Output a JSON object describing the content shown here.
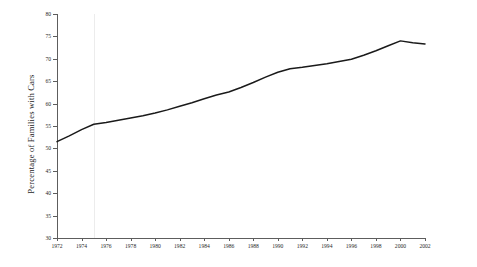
{
  "chart_data": {
    "type": "line",
    "title": "",
    "xlabel": "",
    "ylabel": "Percentage of Families with Cars",
    "xlim": [
      1972,
      2002
    ],
    "ylim": [
      30,
      80
    ],
    "ytick_step": 5,
    "xtick_step": 2,
    "grid": "single faint vertical gridline near 1975",
    "legend": "none",
    "yticks": [
      30,
      35,
      40,
      45,
      50,
      55,
      60,
      65,
      70,
      75,
      80
    ],
    "xticks": [
      1972,
      1974,
      1976,
      1978,
      1980,
      1982,
      1984,
      1986,
      1988,
      1990,
      1992,
      1994,
      1996,
      1998,
      2000,
      2002
    ],
    "line_color": "#1a1a1a",
    "series": [
      {
        "name": "Percentage of Families with Cars",
        "x": [
          1972,
          1973,
          1974,
          1975,
          1976,
          1977,
          1978,
          1979,
          1980,
          1981,
          1982,
          1983,
          1984,
          1985,
          1986,
          1987,
          1988,
          1989,
          1990,
          1991,
          1992,
          1993,
          1994,
          1995,
          1996,
          1997,
          1998,
          1999,
          2000,
          2001,
          2002
        ],
        "values": [
          51.5,
          52.8,
          54.2,
          55.4,
          55.8,
          56.3,
          56.8,
          57.3,
          57.9,
          58.6,
          59.4,
          60.2,
          61.1,
          61.9,
          62.6,
          63.6,
          64.7,
          65.9,
          67.0,
          67.8,
          68.1,
          68.5,
          68.9,
          69.4,
          69.9,
          70.8,
          71.8,
          72.9,
          74.0,
          73.6,
          73.3
        ]
      }
    ]
  }
}
